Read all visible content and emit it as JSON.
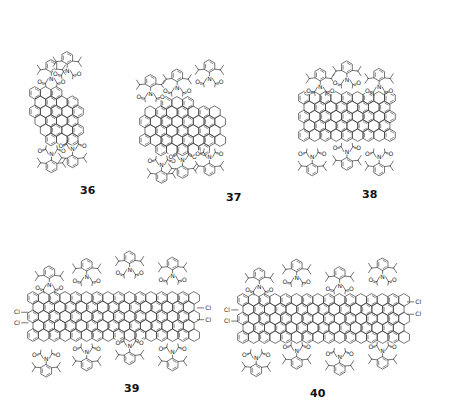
{
  "figure": {
    "compounds": [
      {
        "id": "36",
        "label": "36",
        "pdi_units": 2,
        "imide_groups": 4,
        "aryl_substituent": "2,6-diisopropylphenyl",
        "chlorine_atoms": 0
      },
      {
        "id": "37",
        "label": "37",
        "pdi_units": 3,
        "imide_groups": 6,
        "aryl_substituent": "2,6-diisopropylphenyl",
        "chlorine_atoms": 0
      },
      {
        "id": "38",
        "label": "38",
        "pdi_units": 3,
        "imide_groups": 6,
        "aryl_substituent": "2,6-diisopropylphenyl",
        "chlorine_atoms": 0
      },
      {
        "id": "39",
        "label": "39",
        "pdi_units": 4,
        "imide_groups": 8,
        "aryl_substituent": "2,6-diisopropylphenyl",
        "chlorine_atoms": 4
      },
      {
        "id": "40",
        "label": "40",
        "pdi_units": 4,
        "imide_groups": 8,
        "aryl_substituent": "2,6-diisopropylphenyl",
        "chlorine_atoms": 4
      }
    ],
    "atom_labels": {
      "nitrogen": "N",
      "oxygen": "O",
      "chlorine": "Cl"
    }
  }
}
